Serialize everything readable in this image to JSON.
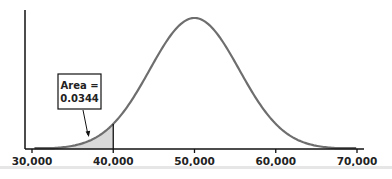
{
  "chart_data": {
    "type": "area",
    "title": "",
    "xlabel": "",
    "ylabel": "",
    "distribution": "normal",
    "mean": 50000,
    "std_dev": 5500,
    "x_ticks": [
      30000,
      40000,
      50000,
      60000,
      70000
    ],
    "x_tick_labels": [
      "30,000",
      "40,000",
      "50,000",
      "60,000",
      "70,000"
    ],
    "xlim": [
      30000,
      70000
    ],
    "shaded_region": {
      "from": 30000,
      "to": 40000,
      "color": "#d9d9d9"
    },
    "annotation": {
      "line1": "Area =",
      "line2": "0.0344",
      "points_to": "shaded_region"
    },
    "grid": false,
    "legend": null,
    "curve_color": "#6e6e6e",
    "axis_color": "#111111"
  }
}
